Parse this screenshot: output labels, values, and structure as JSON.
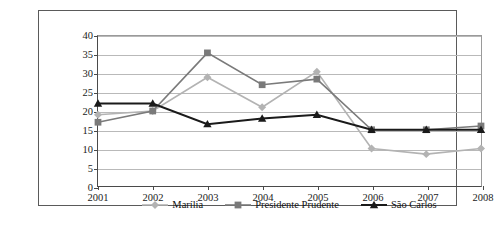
{
  "chart_data": {
    "type": "line",
    "title": "",
    "xlabel": "",
    "ylabel": "",
    "categories": [
      "2001",
      "2002",
      "2003",
      "2004",
      "2005",
      "2006",
      "2007",
      "2008"
    ],
    "ylim": [
      0,
      40
    ],
    "ytick_step": 5,
    "yticks": [
      "40",
      "35",
      "30",
      "25",
      "20",
      "15",
      "10",
      "5",
      "0"
    ],
    "grid": true,
    "legend_position": "bottom",
    "series": [
      {
        "name": "Marília",
        "color": "#b3b3b3",
        "marker": "diamond",
        "values": [
          19,
          20,
          29,
          21,
          30.5,
          10,
          8.5,
          10
        ]
      },
      {
        "name": "Presidente Prudente",
        "color": "#7a7a7a",
        "marker": "square",
        "values": [
          17,
          20,
          35.5,
          27,
          28.5,
          15,
          15,
          16
        ]
      },
      {
        "name": "São Carlos",
        "color": "#1a1a1a",
        "marker": "triangle",
        "values": [
          22,
          22,
          16.5,
          18,
          19,
          15,
          15,
          15
        ]
      }
    ]
  },
  "legend": {
    "items": [
      {
        "label": "Marília"
      },
      {
        "label": "Presidente Prudente"
      },
      {
        "label": "São Carlos"
      }
    ]
  },
  "colors": {
    "grid": "#b9b9b9",
    "axis": "#4a4a4a",
    "frame": "#5a5a5a",
    "background": "#ffffff"
  }
}
